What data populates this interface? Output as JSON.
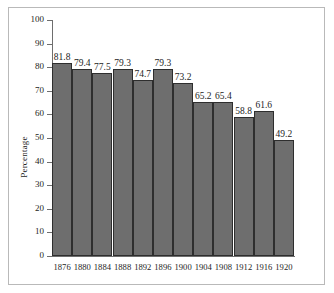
{
  "chart_data": {
    "type": "bar",
    "title": "",
    "xlabel": "",
    "ylabel": "Percentage",
    "ylim": [
      0,
      100
    ],
    "yticks": [
      0,
      10,
      20,
      30,
      40,
      50,
      60,
      70,
      80,
      90,
      100
    ],
    "ytick_labels": [
      "0",
      "10",
      "20",
      "30",
      "40",
      "50",
      "60",
      "70",
      "80",
      "90",
      "100"
    ],
    "grid": false,
    "legend": null,
    "bar_color": "#6e6e6e",
    "bar_edge_color": "#2e2e2e",
    "frame_color": "#b9b9b9",
    "axis_color": "#6e6e6e",
    "categories": [
      "1876",
      "1880",
      "1884",
      "1888",
      "1892",
      "1896",
      "1900",
      "1904",
      "1908",
      "1912",
      "1916",
      "1920"
    ],
    "values": [
      81.8,
      79.4,
      77.5,
      79.3,
      74.7,
      79.3,
      73.2,
      65.2,
      65.4,
      58.8,
      61.6,
      49.2
    ],
    "data_labels": [
      "81.8",
      "79.4",
      "77.5",
      "79.3",
      "74.7",
      "79.3",
      "73.2",
      "65.2",
      "65.4",
      "58.8",
      "61.6",
      "49.2"
    ]
  }
}
